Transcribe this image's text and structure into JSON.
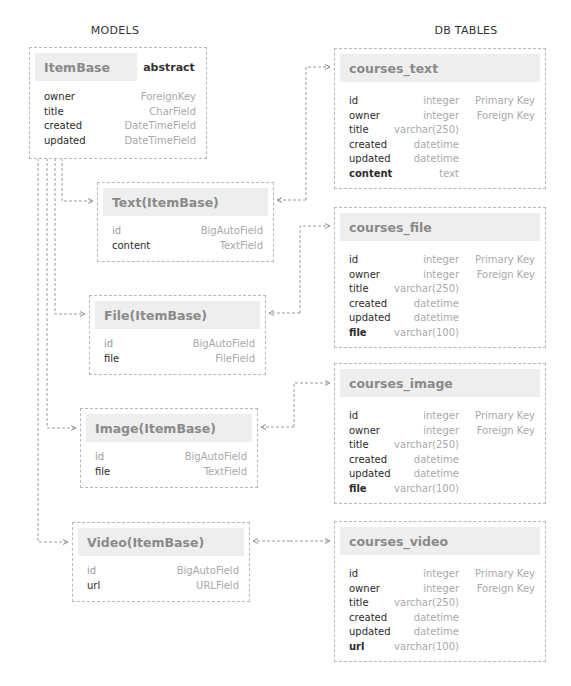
{
  "headings": {
    "models": "MODELS",
    "tables": "DB TABLES"
  },
  "models": {
    "itembase": {
      "title": "ItemBase",
      "badge": "abstract",
      "fields": [
        {
          "name": "owner",
          "type": "ForeignKey"
        },
        {
          "name": "title",
          "type": "CharField"
        },
        {
          "name": "created",
          "type": "DateTimeField"
        },
        {
          "name": "updated",
          "type": "DateTimeField"
        }
      ]
    },
    "text": {
      "title": "Text(ItemBase)",
      "fields": [
        {
          "name": "id",
          "type": "BigAutoField"
        },
        {
          "name": "content",
          "type": "TextField"
        }
      ]
    },
    "file": {
      "title": "File(ItemBase)",
      "fields": [
        {
          "name": "id",
          "type": "BigAutoField"
        },
        {
          "name": "file",
          "type": "FileField"
        }
      ]
    },
    "image": {
      "title": "Image(ItemBase)",
      "fields": [
        {
          "name": "id",
          "type": "BigAutoField"
        },
        {
          "name": "file",
          "type": "TextField"
        }
      ]
    },
    "video": {
      "title": "Video(ItemBase)",
      "fields": [
        {
          "name": "id",
          "type": "BigAutoField"
        },
        {
          "name": "url",
          "type": "URLField"
        }
      ]
    }
  },
  "tables": {
    "courses_text": {
      "title": "courses_text",
      "columns": [
        {
          "name": "id",
          "type": "integer",
          "key": "Primary Key"
        },
        {
          "name": "owner",
          "type": "integer",
          "key": "Foreign Key"
        },
        {
          "name": "title",
          "type": "varchar(250)",
          "key": ""
        },
        {
          "name": "created",
          "type": "datetime",
          "key": ""
        },
        {
          "name": "updated",
          "type": "datetime",
          "key": ""
        },
        {
          "name": "content",
          "type": "text",
          "key": ""
        }
      ]
    },
    "courses_file": {
      "title": "courses_file",
      "columns": [
        {
          "name": "id",
          "type": "integer",
          "key": "Primary Key"
        },
        {
          "name": "owner",
          "type": "integer",
          "key": "Foreign Key"
        },
        {
          "name": "title",
          "type": "varchar(250)",
          "key": ""
        },
        {
          "name": "created",
          "type": "datetime",
          "key": ""
        },
        {
          "name": "updated",
          "type": "datetime",
          "key": ""
        },
        {
          "name": "file",
          "type": "varchar(100)",
          "key": ""
        }
      ]
    },
    "courses_image": {
      "title": "courses_image",
      "columns": [
        {
          "name": "id",
          "type": "integer",
          "key": "Primary Key"
        },
        {
          "name": "owner",
          "type": "integer",
          "key": "Foreign Key"
        },
        {
          "name": "title",
          "type": "varchar(250)",
          "key": ""
        },
        {
          "name": "created",
          "type": "datetime",
          "key": ""
        },
        {
          "name": "updated",
          "type": "datetime",
          "key": ""
        },
        {
          "name": "file",
          "type": "varchar(100)",
          "key": ""
        }
      ]
    },
    "courses_video": {
      "title": "courses_video",
      "columns": [
        {
          "name": "id",
          "type": "integer",
          "key": "Primary Key"
        },
        {
          "name": "owner",
          "type": "integer",
          "key": "Foreign Key"
        },
        {
          "name": "title",
          "type": "varchar(250)",
          "key": ""
        },
        {
          "name": "created",
          "type": "datetime",
          "key": ""
        },
        {
          "name": "updated",
          "type": "datetime",
          "key": ""
        },
        {
          "name": "url",
          "type": "varchar(100)",
          "key": ""
        }
      ]
    }
  },
  "colors": {
    "border": "#b8b8b8",
    "header_bg": "#eeeeee",
    "title_text": "#8a8a8a",
    "muted_text": "#a9a9a9",
    "body_text": "#2b2b2b"
  }
}
